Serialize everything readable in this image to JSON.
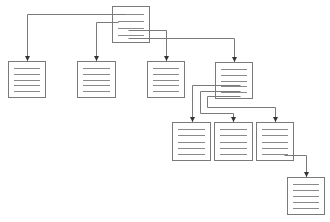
{
  "diagram": {
    "type": "tree",
    "colors": {
      "stroke": "#7a7a7a",
      "line": "#8a8a8a",
      "background": "#ffffff"
    },
    "nodes": [
      {
        "id": "root",
        "x": 112,
        "y": 6,
        "w": 38,
        "h": 37,
        "lines": 4
      },
      {
        "id": "c1",
        "x": 8,
        "y": 61,
        "w": 38,
        "h": 37,
        "lines": 5
      },
      {
        "id": "c2",
        "x": 77,
        "y": 61,
        "w": 39,
        "h": 37,
        "lines": 5
      },
      {
        "id": "c3",
        "x": 147,
        "y": 61,
        "w": 38,
        "h": 37,
        "lines": 5
      },
      {
        "id": "c4",
        "x": 215,
        "y": 62,
        "w": 38,
        "h": 37,
        "lines": 5
      },
      {
        "id": "g1",
        "x": 172,
        "y": 122,
        "w": 39,
        "h": 39,
        "lines": 5
      },
      {
        "id": "g2",
        "x": 214,
        "y": 122,
        "w": 39,
        "h": 39,
        "lines": 5
      },
      {
        "id": "g3",
        "x": 256,
        "y": 122,
        "w": 38,
        "h": 39,
        "lines": 5
      },
      {
        "id": "gg1",
        "x": 287,
        "y": 177,
        "w": 38,
        "h": 38,
        "lines": 5
      }
    ],
    "edges": [
      {
        "from": "root",
        "to": "c1",
        "points": [
          [
            125,
            14
          ],
          [
            27,
            14
          ],
          [
            27,
            61
          ]
        ]
      },
      {
        "from": "root",
        "to": "c2",
        "points": [
          [
            118,
            22
          ],
          [
            96,
            22
          ],
          [
            96,
            61
          ]
        ]
      },
      {
        "from": "root",
        "to": "c3",
        "points": [
          [
            128,
            30
          ],
          [
            166,
            30
          ],
          [
            166,
            61
          ]
        ]
      },
      {
        "from": "root",
        "to": "c4",
        "points": [
          [
            128,
            38
          ],
          [
            234,
            38
          ],
          [
            234,
            62
          ]
        ]
      },
      {
        "from": "c4",
        "to": "g1",
        "points": [
          [
            240,
            85
          ],
          [
            192,
            85
          ],
          [
            192,
            122
          ]
        ]
      },
      {
        "from": "c4",
        "to": "g2",
        "points": [
          [
            240,
            91
          ],
          [
            200,
            91
          ],
          [
            200,
            113
          ],
          [
            233,
            113
          ],
          [
            233,
            122
          ]
        ]
      },
      {
        "from": "c4",
        "to": "g3",
        "points": [
          [
            240,
            96
          ],
          [
            207,
            96
          ],
          [
            207,
            107
          ],
          [
            275,
            107
          ],
          [
            275,
            122
          ]
        ]
      },
      {
        "from": "g3",
        "to": "gg1",
        "points": [
          [
            284,
            155
          ],
          [
            306,
            155
          ],
          [
            306,
            177
          ]
        ]
      }
    ]
  }
}
